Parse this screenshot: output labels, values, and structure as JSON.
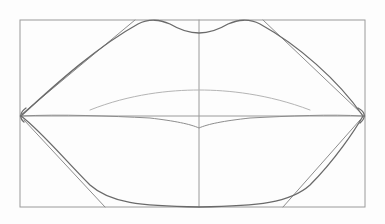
{
  "image": {
    "subject": "pencil construction sketch of lips",
    "width": 385,
    "height": 224,
    "background": "#fdfdfd",
    "colors": {
      "guide": "#9a9a9a",
      "dark": "#6a6a6a",
      "mid": "#8d8d8d",
      "light": "#b4b4b4"
    }
  },
  "drawing": {
    "bounding_box": {
      "left": 20,
      "top": 20,
      "right": 365,
      "bottom": 207
    },
    "center_vertical_x": 199,
    "mouth_line_y": 116,
    "corners": {
      "left": [
        21,
        116
      ],
      "right": [
        363,
        116
      ]
    },
    "paths": {
      "upper_lip_outer": "M21,116 C60,80 100,45 138,24 C150,18 160,20 170,24 C180,30 190,33 199,33 C208,33 218,30 228,24 C238,20 248,18 260,24 C298,45 338,80 363,116",
      "upper_lip_outer_guide": "M22,114 L135,20 M263,20 L362,114",
      "upper_lip_lower_edge": "M90,110 C130,94 170,90 199,90 C228,90 268,94 310,110",
      "mouth_line": "M21,116 C60,114 110,116 150,118 C175,121 190,124 199,128 C208,124 223,121 250,118 C290,116 330,114 363,116",
      "lower_lip_outer": "M21,116 C40,130 65,160 90,185 C110,203 140,206 199,207 C258,206 290,203 310,185 C335,160 355,130 363,116",
      "lower_lip_outer_guide": "M24,120 L105,207 M283,207 L360,120"
    }
  }
}
